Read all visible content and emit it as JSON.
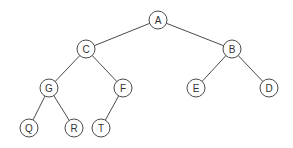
{
  "diagram": {
    "type": "binary-tree",
    "node_radius": 9,
    "colors": {
      "stroke": "#4a4a4a",
      "fill": "#ffffff",
      "text": "#333333",
      "background": "#ffffff"
    },
    "nodes": [
      {
        "id": "A",
        "label": "A",
        "x": 158,
        "y": 20
      },
      {
        "id": "C",
        "label": "C",
        "x": 86,
        "y": 49
      },
      {
        "id": "B",
        "label": "B",
        "x": 232,
        "y": 49
      },
      {
        "id": "G",
        "label": "G",
        "x": 49,
        "y": 88
      },
      {
        "id": "F",
        "label": "F",
        "x": 123,
        "y": 88
      },
      {
        "id": "E",
        "label": "E",
        "x": 196,
        "y": 88
      },
      {
        "id": "D",
        "label": "D",
        "x": 269,
        "y": 88
      },
      {
        "id": "Q",
        "label": "Q",
        "x": 29,
        "y": 128
      },
      {
        "id": "R",
        "label": "R",
        "x": 74,
        "y": 128
      },
      {
        "id": "T",
        "label": "T",
        "x": 101,
        "y": 128
      }
    ],
    "edges": [
      {
        "from": "A",
        "to": "C"
      },
      {
        "from": "A",
        "to": "B"
      },
      {
        "from": "C",
        "to": "G"
      },
      {
        "from": "C",
        "to": "F"
      },
      {
        "from": "B",
        "to": "E"
      },
      {
        "from": "B",
        "to": "D"
      },
      {
        "from": "G",
        "to": "Q"
      },
      {
        "from": "G",
        "to": "R"
      },
      {
        "from": "F",
        "to": "T"
      }
    ]
  }
}
